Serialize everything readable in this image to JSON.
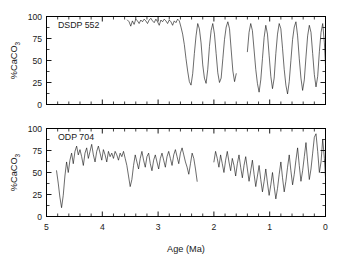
{
  "figure": {
    "background_color": "#ffffff",
    "line_color": "#111111",
    "axis_color": "#000000"
  },
  "axis": {
    "x_title": "Age (Ma)",
    "x_ticklabels": [
      "5",
      "4",
      "3",
      "2",
      "1",
      "0"
    ],
    "y_title_main": "%CaCO",
    "y_title_sub": "3",
    "y_ticklabels": [
      "0",
      "25",
      "50",
      "75",
      "100"
    ]
  },
  "panels": [
    {
      "id": "dsdp-552",
      "label": "DSDP 552"
    },
    {
      "id": "odp-704",
      "label": "ODP 704"
    }
  ],
  "chart_data": [
    {
      "type": "line",
      "title": "DSDP 552",
      "xlabel": "Age (Ma)",
      "ylabel": "%CaCO3",
      "xlim": [
        5,
        0
      ],
      "ylim": [
        0,
        100
      ],
      "x_inverted": true,
      "grid": false,
      "legend": "none",
      "x_major_ticks": [
        5,
        4,
        3,
        2,
        1,
        0
      ],
      "x_minor_tick_interval": 0.2,
      "y_ticks": [
        0,
        25,
        50,
        75,
        100
      ],
      "segments": [
        {
          "name": "DSDP 552 early Pliocene plateau",
          "x": [
            3.55,
            3.52,
            3.49,
            3.46,
            3.43,
            3.4,
            3.37,
            3.34,
            3.31,
            3.28,
            3.25,
            3.22,
            3.19,
            3.16,
            3.13,
            3.1,
            3.07,
            3.04,
            3.01,
            2.98,
            2.95,
            2.92,
            2.89,
            2.86,
            2.83,
            2.8,
            2.77,
            2.74,
            2.71,
            2.68,
            2.65,
            2.62,
            2.59,
            2.56,
            2.53,
            2.5,
            2.47,
            2.44,
            2.41,
            2.38,
            2.35,
            2.32,
            2.29,
            2.26,
            2.23,
            2.2,
            2.17,
            2.14,
            2.11,
            2.08,
            2.05,
            2.02,
            1.99,
            1.96,
            1.93,
            1.9,
            1.87,
            1.84,
            1.81,
            1.78,
            1.75,
            1.72,
            1.69,
            1.66,
            1.63,
            1.6
          ],
          "y": [
            96,
            94,
            89,
            95,
            91,
            97,
            95,
            92,
            96,
            94,
            97,
            95,
            92,
            96,
            98,
            95,
            93,
            97,
            94,
            90,
            96,
            94,
            97,
            95,
            92,
            96,
            94,
            90,
            95,
            93,
            97,
            95,
            88,
            80,
            68,
            52,
            38,
            26,
            22,
            35,
            58,
            78,
            92,
            86,
            70,
            45,
            30,
            24,
            40,
            66,
            84,
            92,
            80,
            58,
            36,
            25,
            30,
            52,
            74,
            88,
            94,
            86,
            62,
            38,
            26,
            35
          ]
        },
        {
          "name": "DSDP 552 late Pliocene-Pleistocene",
          "x": [
            1.4,
            1.37,
            1.34,
            1.31,
            1.28,
            1.25,
            1.22,
            1.19,
            1.16,
            1.13,
            1.1,
            1.07,
            1.04,
            1.01,
            0.98,
            0.95,
            0.92,
            0.89,
            0.86,
            0.83,
            0.8,
            0.77,
            0.74,
            0.71,
            0.68,
            0.65,
            0.62,
            0.59,
            0.56,
            0.53,
            0.5,
            0.47,
            0.44,
            0.41,
            0.38,
            0.35,
            0.32,
            0.29,
            0.26,
            0.23,
            0.2,
            0.17,
            0.14,
            0.11,
            0.08,
            0.05,
            0.02,
            0.0
          ],
          "y": [
            60,
            82,
            92,
            84,
            62,
            40,
            24,
            14,
            28,
            52,
            76,
            90,
            80,
            56,
            32,
            18,
            30,
            58,
            80,
            92,
            86,
            64,
            40,
            22,
            12,
            26,
            50,
            74,
            88,
            94,
            78,
            52,
            30,
            16,
            28,
            54,
            78,
            90,
            82,
            58,
            34,
            20,
            32,
            60,
            82,
            92,
            70,
            44
          ]
        }
      ]
    },
    {
      "type": "line",
      "title": "ODP 704",
      "xlabel": "Age (Ma)",
      "ylabel": "%CaCO3",
      "xlim": [
        5,
        0
      ],
      "ylim": [
        0,
        100
      ],
      "x_inverted": true,
      "grid": false,
      "legend": "none",
      "x_major_ticks": [
        5,
        4,
        3,
        2,
        1,
        0
      ],
      "x_minor_tick_interval": 0.2,
      "y_ticks": [
        0,
        25,
        50,
        75,
        100
      ],
      "segments": [
        {
          "name": "ODP 704 Pliocene",
          "x": [
            4.82,
            4.79,
            4.76,
            4.73,
            4.7,
            4.67,
            4.64,
            4.61,
            4.58,
            4.55,
            4.52,
            4.49,
            4.46,
            4.43,
            4.4,
            4.37,
            4.34,
            4.31,
            4.28,
            4.25,
            4.22,
            4.19,
            4.16,
            4.13,
            4.1,
            4.07,
            4.04,
            4.01,
            3.98,
            3.95,
            3.92,
            3.89,
            3.86,
            3.83,
            3.8,
            3.77,
            3.74,
            3.71,
            3.68,
            3.65,
            3.62,
            3.59,
            3.56,
            3.53,
            3.5,
            3.47,
            3.44,
            3.41,
            3.38,
            3.35,
            3.32,
            3.29,
            3.26,
            3.23,
            3.2,
            3.17,
            3.14,
            3.11,
            3.08,
            3.05,
            3.02,
            2.99,
            2.96,
            2.93,
            2.9,
            2.87,
            2.84,
            2.81,
            2.78,
            2.75,
            2.72,
            2.69,
            2.66,
            2.63,
            2.6,
            2.57,
            2.54,
            2.51,
            2.48,
            2.45,
            2.42,
            2.39,
            2.36,
            2.33,
            2.3
          ],
          "y": [
            52,
            38,
            22,
            10,
            24,
            46,
            62,
            50,
            64,
            72,
            60,
            74,
            80,
            70,
            76,
            68,
            58,
            72,
            78,
            66,
            74,
            82,
            70,
            62,
            74,
            80,
            72,
            64,
            76,
            70,
            62,
            74,
            68,
            72,
            66,
            74,
            70,
            64,
            72,
            68,
            74,
            66,
            58,
            46,
            34,
            42,
            58,
            70,
            62,
            54,
            66,
            74,
            64,
            56,
            68,
            72,
            60,
            52,
            64,
            70,
            62,
            54,
            66,
            72,
            64,
            56,
            68,
            74,
            66,
            58,
            70,
            76,
            68,
            60,
            72,
            78,
            70,
            62,
            56,
            48,
            60,
            72,
            66,
            54,
            40
          ]
        },
        {
          "name": "ODP 704 Pleistocene",
          "x": [
            2.0,
            1.97,
            1.94,
            1.91,
            1.88,
            1.85,
            1.82,
            1.79,
            1.76,
            1.73,
            1.7,
            1.67,
            1.64,
            1.61,
            1.58,
            1.55,
            1.52,
            1.49,
            1.46,
            1.43,
            1.4,
            1.37,
            1.34,
            1.31,
            1.28,
            1.25,
            1.22,
            1.19,
            1.16,
            1.13,
            1.1,
            1.07,
            1.04,
            1.01,
            0.98,
            0.95,
            0.92,
            0.89,
            0.86,
            0.83,
            0.8,
            0.77,
            0.74,
            0.71,
            0.68,
            0.65,
            0.62,
            0.59,
            0.56,
            0.53,
            0.5,
            0.47,
            0.44,
            0.41,
            0.38,
            0.35,
            0.32,
            0.29,
            0.26,
            0.23,
            0.2,
            0.17,
            0.14,
            0.11,
            0.08,
            0.05,
            0.02,
            0.0
          ],
          "y": [
            62,
            74,
            66,
            56,
            70,
            60,
            50,
            64,
            74,
            62,
            52,
            66,
            58,
            46,
            60,
            70,
            56,
            44,
            58,
            68,
            54,
            40,
            52,
            64,
            48,
            34,
            46,
            58,
            42,
            28,
            40,
            54,
            38,
            24,
            36,
            50,
            34,
            20,
            32,
            48,
            62,
            44,
            28,
            40,
            56,
            70,
            52,
            36,
            48,
            64,
            78,
            58,
            40,
            52,
            68,
            84,
            62,
            42,
            54,
            72,
            90,
            94,
            74,
            50,
            62,
            88,
            66,
            44
          ]
        }
      ]
    }
  ]
}
